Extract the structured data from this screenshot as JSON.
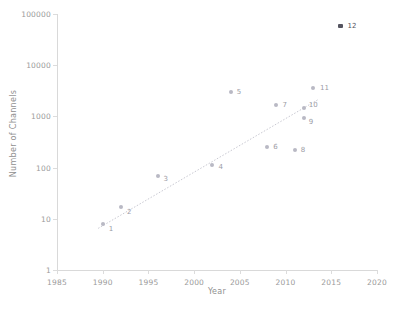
{
  "chart_data": {
    "type": "scatter",
    "title": "",
    "xlabel": "Year",
    "ylabel": "Number of Channels",
    "xlim": [
      1985,
      2020
    ],
    "ylim": [
      1,
      100000
    ],
    "yscale": "log",
    "xticks": [
      "1985",
      "1990",
      "1995",
      "2000",
      "2005",
      "2010",
      "2015",
      "2020"
    ],
    "xtick_values": [
      1985,
      1990,
      1995,
      2000,
      2005,
      2010,
      2015,
      2020
    ],
    "yticks": [
      "1",
      "10",
      "100",
      "1000",
      "10000",
      "100000"
    ],
    "ytick_values": [
      1,
      10,
      100,
      1000,
      10000,
      100000
    ],
    "grid": false,
    "legend": "none",
    "points": [
      {
        "label": "1",
        "x": 1990,
        "y": 8,
        "style": "light",
        "label_dx": 6,
        "label_dy": 5
      },
      {
        "label": "2",
        "x": 1992,
        "y": 17,
        "style": "light",
        "label_dx": 6,
        "label_dy": 5
      },
      {
        "label": "3",
        "x": 1996,
        "y": 70,
        "style": "light",
        "label_dx": 6,
        "label_dy": 3
      },
      {
        "label": "4",
        "x": 2002,
        "y": 110,
        "style": "light",
        "label_dx": 6,
        "label_dy": 2
      },
      {
        "label": "5",
        "x": 2004,
        "y": 3000,
        "style": "light",
        "label_dx": 6,
        "label_dy": 0
      },
      {
        "label": "6",
        "x": 2008,
        "y": 250,
        "style": "light",
        "label_dx": 6,
        "label_dy": 0
      },
      {
        "label": "7",
        "x": 2009,
        "y": 1700,
        "style": "light",
        "label_dx": 6,
        "label_dy": 0
      },
      {
        "label": "8",
        "x": 2011,
        "y": 220,
        "style": "light",
        "label_dx": 6,
        "label_dy": 0
      },
      {
        "label": "9",
        "x": 2012,
        "y": 950,
        "style": "light",
        "label_dx": 5,
        "label_dy": 4
      },
      {
        "label": "10",
        "x": 2012,
        "y": 1450,
        "style": "light",
        "label_dx": 5,
        "label_dy": -3
      },
      {
        "label": "11",
        "x": 2013,
        "y": 3600,
        "style": "light",
        "label_dx": 7,
        "label_dy": 0
      },
      {
        "label": "12",
        "x": 2016,
        "y": 58000,
        "style": "dark",
        "label_dx": 7,
        "label_dy": 0
      }
    ],
    "trendline": {
      "visible": true,
      "style": "dotted",
      "x_start": 1989.5,
      "y_start": 6.5,
      "x_end": 2013.5,
      "y_end": 2100
    }
  },
  "colors": {
    "point_light": "#b9b9c4",
    "point_dark": "#555560",
    "axis": "#d9d9d9",
    "tick_text": "#9a9a9a",
    "axis_title": "#8f8f8f",
    "trendline": "#c9c9d2",
    "background": "#ffffff"
  }
}
